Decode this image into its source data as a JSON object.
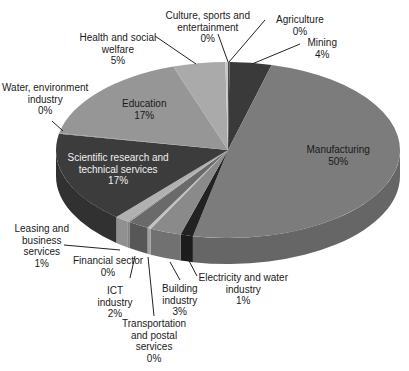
{
  "chart_data": {
    "type": "pie",
    "style": "3d",
    "title": "",
    "start_angle_deg": 0,
    "direction": "clockwise",
    "categories": [
      "Agriculture",
      "Mining",
      "Manufacturing",
      "Electricity and water industry",
      "Building industry",
      "Transportation and postal services",
      "ICT industry",
      "Financial sector",
      "Leasing and business services",
      "Scientific research and technical services",
      "Water, environment industry",
      "Education",
      "Health and social welfare",
      "Culture, sports and entertainment"
    ],
    "values": [
      0,
      4,
      50,
      1,
      3,
      0,
      2,
      0,
      1,
      17,
      0,
      17,
      5,
      0
    ],
    "value_labels": [
      "0%",
      "4%",
      "50%",
      "1%",
      "3%",
      "0%",
      "2%",
      "0%",
      "1%",
      "17%",
      "0%",
      "17%",
      "5%",
      "0%"
    ],
    "plot_weights": [
      0.15,
      4,
      50,
      1.2,
      3,
      0.35,
      2,
      0.25,
      1.3,
      17,
      0.15,
      17,
      5,
      0.25
    ],
    "colors": [
      "#4a4a4a",
      "#3a3a3a",
      "#7c7c7c",
      "#222222",
      "#8a8a8a",
      "#c2c2c2",
      "#6a6a6a",
      "#a0a0a0",
      "#b0b0b0",
      "#3c3c3c",
      "#8e8e8e",
      "#969696",
      "#aaaaaa",
      "#c8c8c8"
    ],
    "legend": "none (leader-line labels)"
  },
  "labels": [
    {
      "name": "Agriculture",
      "lines": [
        "Agriculture",
        "0%"
      ],
      "x": 300,
      "y": 14,
      "ax": 265,
      "ay": 20,
      "tx": 229,
      "ty": 62,
      "dark": false
    },
    {
      "name": "Mining",
      "lines": [
        "Mining",
        "4%"
      ],
      "x": 322,
      "y": 37,
      "ax": 300,
      "ay": 44,
      "tx": 252,
      "ty": 64,
      "dark": false
    },
    {
      "name": "Manufacturing",
      "lines": [
        "Manufacturing",
        "50%"
      ],
      "x": 338,
      "y": 144,
      "dark": false
    },
    {
      "name": "Electricity and water industry",
      "lines": [
        "Electricity and water",
        "industry",
        "1%"
      ],
      "x": 243,
      "y": 272,
      "ax": 197,
      "ay": 276,
      "tx": 188,
      "ty": 259,
      "dark": false
    },
    {
      "name": "Building industry",
      "lines": [
        "Building",
        "industry",
        "3%"
      ],
      "x": 180,
      "y": 283,
      "ax": 180,
      "ay": 280,
      "tx": 170,
      "ty": 262,
      "dark": false
    },
    {
      "name": "Transportation and postal services",
      "lines": [
        "Transportation",
        "and postal",
        "services",
        "0%"
      ],
      "x": 154,
      "y": 318,
      "ax": 154,
      "ay": 316,
      "tx": 148,
      "ty": 257,
      "dark": false
    },
    {
      "name": "ICT industry",
      "lines": [
        "ICT",
        "industry",
        "2%"
      ],
      "x": 115,
      "y": 285,
      "ax": 130,
      "ay": 278,
      "tx": 135,
      "ty": 256,
      "dark": false
    },
    {
      "name": "Financial sector",
      "lines": [
        "Financial sector",
        "0%"
      ],
      "x": 108,
      "y": 255,
      "dark": false
    },
    {
      "name": "Leasing and business services",
      "lines": [
        "Leasing and",
        "business",
        "services",
        "1%"
      ],
      "x": 42,
      "y": 223,
      "ax": 64,
      "ay": 245,
      "tx": 120,
      "ty": 250,
      "dark": false
    },
    {
      "name": "Scientific research and technical services",
      "lines": [
        "Scientific research and",
        "technical services",
        "17%"
      ],
      "x": 118,
      "y": 152,
      "dark": true
    },
    {
      "name": "Water, environment industry",
      "lines": [
        "Water, environment",
        "industry",
        "0%"
      ],
      "x": 45,
      "y": 82,
      "ax": 52,
      "ay": 121,
      "tx": 63,
      "ty": 131,
      "dark": false
    },
    {
      "name": "Education",
      "lines": [
        "Education",
        "17%"
      ],
      "x": 144,
      "y": 98,
      "dark": false
    },
    {
      "name": "Health and social welfare",
      "lines": [
        "Health and social",
        "welfare",
        "5%"
      ],
      "x": 118,
      "y": 32,
      "ax": 155,
      "ay": 36,
      "tx": 196,
      "ty": 64,
      "dark": false
    },
    {
      "name": "Culture, sports and entertainment",
      "lines": [
        "Culture, sports and",
        "entertainment",
        "0%"
      ],
      "x": 208,
      "y": 10,
      "ax": 218,
      "ay": 34,
      "tx": 228,
      "ty": 62,
      "dark": false
    }
  ],
  "geometry": {
    "cx": 228,
    "cy": 150,
    "rx": 172,
    "ry": 88,
    "depth": 26
  }
}
